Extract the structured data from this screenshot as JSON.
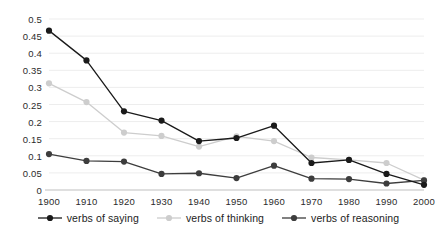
{
  "chart_data": {
    "type": "line",
    "title": "",
    "subtitle": "",
    "xlabel": "",
    "ylabel": "",
    "x": [
      1900,
      1910,
      1920,
      1930,
      1940,
      1950,
      1960,
      1970,
      1980,
      1990,
      2000
    ],
    "categories": [
      "1900",
      "1910",
      "1920",
      "1930",
      "1940",
      "1950",
      "1960",
      "1970",
      "1980",
      "1990",
      "2000"
    ],
    "xlim": [
      1900,
      2000
    ],
    "ylim": [
      0,
      0.5
    ],
    "y_ticks": [
      0,
      0.05,
      0.1,
      0.15,
      0.2,
      0.25,
      0.3,
      0.35,
      0.4,
      0.45,
      0.5
    ],
    "y_tick_labels": [
      "0",
      "0.05",
      "0.1",
      "0.15",
      "0.2",
      "0.25",
      "0.3",
      "0.35",
      "0.4",
      "0.45",
      "0.5"
    ],
    "grid": "horizontal",
    "legend_position": "bottom",
    "series": [
      {
        "name": "verbs of saying",
        "color": "#1a1a1a",
        "marker": "circle",
        "values": [
          0.466,
          0.379,
          0.23,
          0.203,
          0.143,
          0.152,
          0.188,
          0.079,
          0.088,
          0.047,
          0.015
        ]
      },
      {
        "name": "verbs of thinking",
        "color": "#cdcdcd",
        "marker": "circle",
        "values": [
          0.312,
          0.257,
          0.168,
          0.158,
          0.127,
          0.157,
          0.143,
          0.095,
          0.088,
          0.079,
          0.029
        ]
      },
      {
        "name": "verbs of reasoning",
        "color": "#3d3d3d",
        "marker": "circle",
        "values": [
          0.105,
          0.085,
          0.083,
          0.047,
          0.049,
          0.035,
          0.071,
          0.033,
          0.032,
          0.019,
          0.028
        ]
      }
    ]
  },
  "axes": {
    "y_tick_labels": [
      "0.5",
      "0.45",
      "0.4",
      "0.35",
      "0.3",
      "0.25",
      "0.2",
      "0.15",
      "0.1",
      "0.05",
      "0"
    ],
    "x_tick_labels": [
      "1900",
      "1910",
      "1920",
      "1930",
      "1940",
      "1950",
      "1960",
      "1970",
      "1980",
      "1990",
      "2000"
    ]
  },
  "legend": {
    "items": [
      {
        "label": "verbs of saying",
        "color": "#1a1a1a"
      },
      {
        "label": "verbs of thinking",
        "color": "#cdcdcd"
      },
      {
        "label": "verbs of reasoning",
        "color": "#3d3d3d"
      }
    ]
  },
  "colors": {
    "background": "#ffffff",
    "gridline": "#ededed",
    "axis": "#bfbfbf",
    "text": "#2b2b2b",
    "series_saying": "#1a1a1a",
    "series_thinking": "#cdcdcd",
    "series_reasoning": "#3d3d3d"
  }
}
